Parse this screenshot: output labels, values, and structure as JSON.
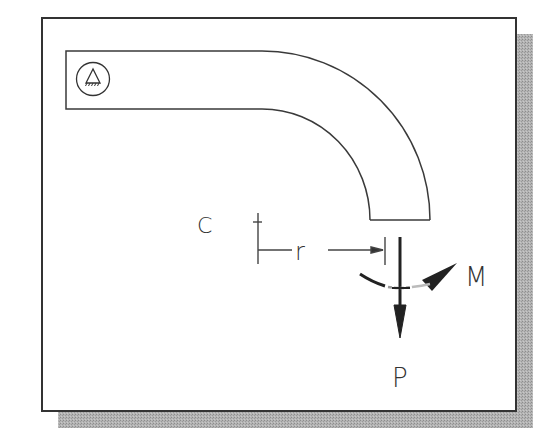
{
  "figure": {
    "type": "curved-beam-free-body-diagram",
    "frame": {
      "background": "#ffffff",
      "border": "#333333",
      "shadow": "#a8a8a8"
    },
    "beam": {
      "shape": "straight segment with quarter-circle bend",
      "support": "fixed-support-icon"
    },
    "labels": {
      "center": "C",
      "radius": "r",
      "moment": "M",
      "load": "P"
    }
  }
}
